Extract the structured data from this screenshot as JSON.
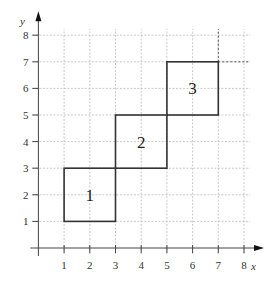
{
  "diagram": {
    "type": "coordinate-grid",
    "axes": {
      "x_label": "x",
      "y_label": "y",
      "x_ticks": [
        "1",
        "2",
        "3",
        "4",
        "5",
        "6",
        "7",
        "8"
      ],
      "y_ticks": [
        "1",
        "2",
        "3",
        "4",
        "5",
        "6",
        "7",
        "8"
      ],
      "x_range": [
        0,
        8
      ],
      "y_range": [
        0,
        8
      ]
    },
    "squares": [
      {
        "label": "1",
        "x0": 1,
        "y0": 1,
        "x1": 3,
        "y1": 3
      },
      {
        "label": "2",
        "x0": 3,
        "y0": 3,
        "x1": 5,
        "y1": 5
      },
      {
        "label": "3",
        "x0": 5,
        "y0": 5,
        "x1": 7,
        "y1": 7
      }
    ],
    "dashed_extension": {
      "corner": [
        7,
        7
      ],
      "to_x": 8,
      "to_y": 8
    },
    "colors": {
      "grid": "#bbbbbb",
      "axis": "#444444",
      "square_stroke": "#333333",
      "text": "#333333"
    }
  }
}
